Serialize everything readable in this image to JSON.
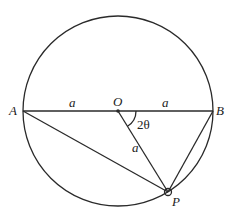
{
  "diagram": {
    "type": "geometry",
    "circle": {
      "cx": 118,
      "cy": 111,
      "r": 95
    },
    "points": {
      "A": {
        "label": "A",
        "x": 23,
        "y": 111
      },
      "O": {
        "label": "O",
        "x": 118,
        "y": 111
      },
      "B": {
        "label": "B",
        "x": 213,
        "y": 111
      },
      "P": {
        "label": "P",
        "x": 168,
        "y": 192
      }
    },
    "segment_labels": {
      "AO": "a",
      "OB": "a",
      "OP": "a"
    },
    "angle_label": "2θ",
    "colors": {
      "stroke": "#2a2a2a",
      "text": "#222222",
      "background": "#ffffff"
    }
  }
}
